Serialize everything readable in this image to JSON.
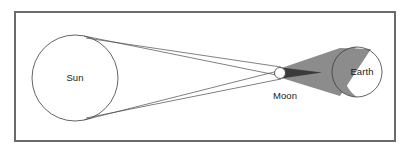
{
  "figure": {
    "name": "solar-eclipse-geometry-diagram",
    "background_color": "#ffffff",
    "border": {
      "color": "#6b6b6b",
      "width_px": 2,
      "x": 15,
      "y": 12,
      "w": 380,
      "h": 129
    }
  },
  "labels": {
    "sun": "Sun",
    "moon": "Moon",
    "earth": "Earth"
  },
  "bodies": {
    "sun": {
      "label": "Sun",
      "shape": "circle",
      "cx": 75,
      "cy": 78,
      "r": 43,
      "fill": "#ffffff",
      "stroke": "#3c3c3c",
      "label_x": 75,
      "label_y": 78
    },
    "moon": {
      "label": "Moon",
      "shape": "circle",
      "cx": 280,
      "cy": 73,
      "r": 5.5,
      "fill": "#ffffff",
      "stroke": "#3c3c3c",
      "label_x": 285,
      "label_y": 96
    },
    "earth": {
      "label": "Earth",
      "shape": "circle",
      "cx": 357,
      "cy": 72,
      "r": 25,
      "fill": "#ffffff",
      "stroke": "#3c3c3c",
      "label_x": 362,
      "label_y": 72
    }
  },
  "shadow": {
    "umbra_color": "#3b3b3b",
    "penumbra_color": "#8c8c8c",
    "earth_shaded_color": "#8c8c8c",
    "umbra_label": "umbra",
    "penumbra_label": "penumbra"
  },
  "rays": {
    "color": "#4a4a4a",
    "width_px": 0.7,
    "count": 4,
    "description": "tangent light rays from Sun limb past Moon"
  },
  "chart_data": {
    "type": "diagram",
    "elements": [
      "Sun",
      "Moon",
      "Earth",
      "umbra",
      "penumbra",
      "light rays"
    ]
  }
}
